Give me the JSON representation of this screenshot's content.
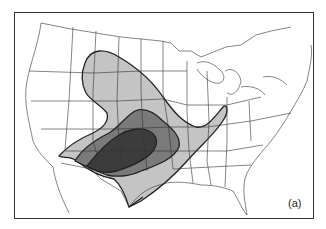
{
  "figure": {
    "panel_label": "(a)",
    "colors": {
      "light_region": "#c4c4c4",
      "medium_region": "#7a7a7a",
      "dark_region": "#3c3c3c",
      "boundary": "#222222",
      "state_lines": "#333333"
    },
    "regions": [
      {
        "level": "outer",
        "shade": "light"
      },
      {
        "level": "middle",
        "shade": "medium"
      },
      {
        "level": "inner",
        "shade": "dark"
      }
    ]
  }
}
